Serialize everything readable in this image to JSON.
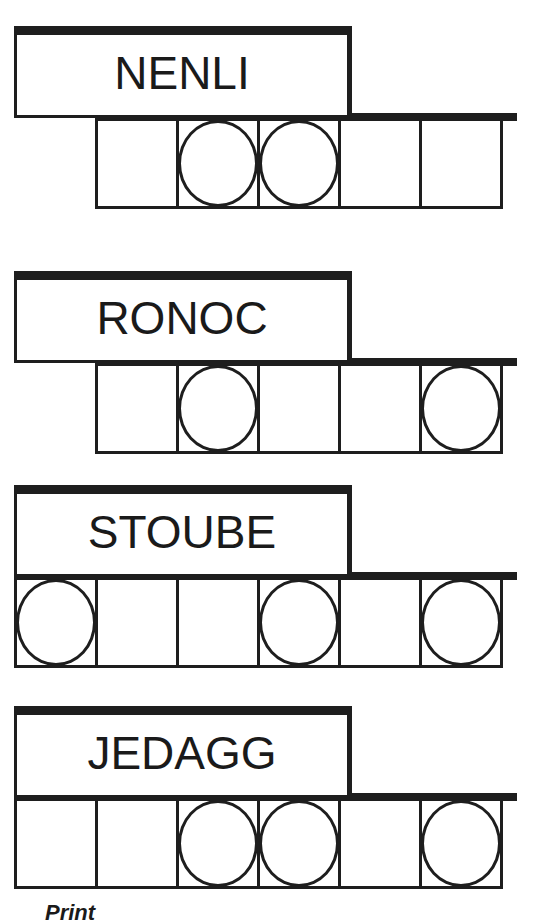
{
  "puzzles": [
    {
      "scrambled": "NENLI",
      "top": 26,
      "start_col": 1,
      "cells": [
        false,
        true,
        true,
        false,
        false
      ]
    },
    {
      "scrambled": "RONOC",
      "top": 271,
      "start_col": 1,
      "cells": [
        false,
        true,
        false,
        false,
        true
      ]
    },
    {
      "scrambled": "STOUBE",
      "top": 485,
      "start_col": 0,
      "cells": [
        true,
        false,
        false,
        true,
        false,
        true
      ]
    },
    {
      "scrambled": "JEDAGG",
      "top": 706,
      "start_col": 0,
      "cells": [
        false,
        false,
        true,
        true,
        false,
        true
      ]
    }
  ],
  "footer": {
    "partial_text": "Print"
  },
  "colors": {
    "ink": "#1e1e1e",
    "background": "#ffffff"
  }
}
